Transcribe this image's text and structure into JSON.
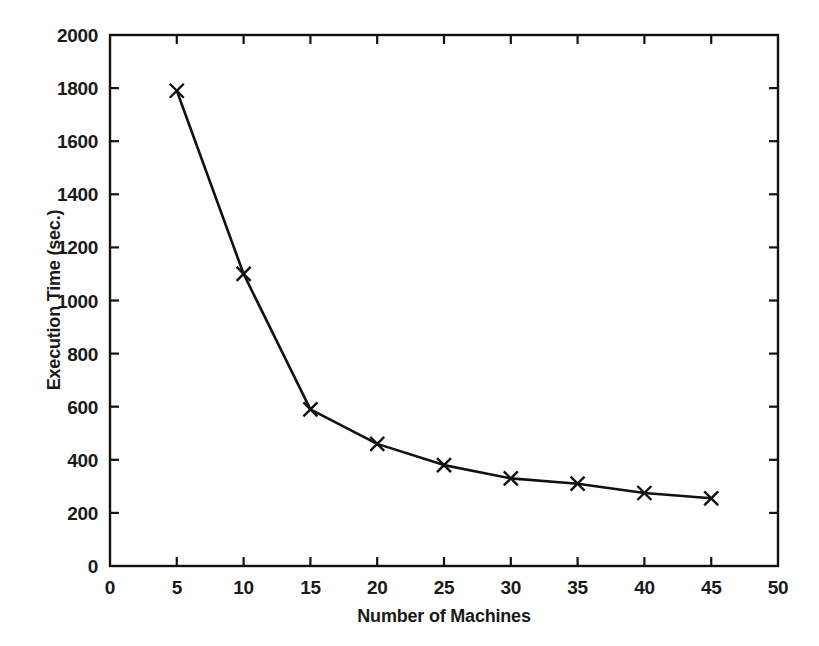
{
  "chart_data": {
    "type": "line",
    "title": "",
    "xlabel": "Number of Machines",
    "ylabel": "Execution Time (sec.)",
    "xlim": [
      0,
      50
    ],
    "ylim": [
      0,
      2000
    ],
    "xticks": [
      0,
      5,
      10,
      15,
      20,
      25,
      30,
      35,
      40,
      45,
      50
    ],
    "xtick_labels": [
      "0",
      "5",
      "10",
      "15",
      "20",
      "25",
      "30",
      "35",
      "40",
      "45",
      "50"
    ],
    "yticks": [
      0,
      200,
      400,
      600,
      800,
      1000,
      1200,
      1400,
      1600,
      1800,
      2000
    ],
    "ytick_labels": [
      "0",
      "200",
      "400",
      "600",
      "800",
      "1000",
      "1200",
      "1400",
      "1600",
      "1800",
      "2000"
    ],
    "grid": false,
    "legend": null,
    "marker": "x",
    "line_color": "#111111",
    "series": [
      {
        "name": "Execution Time",
        "x": [
          5,
          10,
          15,
          20,
          25,
          30,
          35,
          40,
          45
        ],
        "values": [
          1790,
          1100,
          590,
          460,
          380,
          330,
          310,
          275,
          255
        ]
      }
    ]
  },
  "figure": {
    "background_color": "#ffffff",
    "foreground_color": "#111111"
  }
}
